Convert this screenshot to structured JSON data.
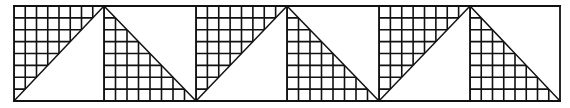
{
  "diagram": {
    "colors": {
      "line": "#111111",
      "background": "#ffffff"
    },
    "frame": {
      "left": 14,
      "top": 6,
      "right": 560,
      "bottom": 101
    },
    "peaks_x": [
      104,
      287,
      470
    ],
    "valleys_x": [
      14,
      196,
      379,
      560
    ],
    "grid_cell": 11.5,
    "panels": [
      {
        "x0": 14,
        "x1": 104,
        "hatched": "upper-left"
      },
      {
        "x0": 104,
        "x1": 196,
        "hatched": "lower-left"
      },
      {
        "x0": 196,
        "x1": 287,
        "hatched": "upper-left"
      },
      {
        "x0": 287,
        "x1": 379,
        "hatched": "lower-left"
      },
      {
        "x0": 379,
        "x1": 470,
        "hatched": "upper-left"
      },
      {
        "x0": 470,
        "x1": 560,
        "hatched": "lower-left"
      }
    ]
  }
}
